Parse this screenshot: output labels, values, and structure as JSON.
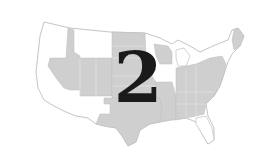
{
  "figure": {
    "number_label": "2",
    "colors": {
      "background": "#ffffff",
      "shaded_state": "#cfcfcf",
      "unshaded_state": "#ffffff",
      "border": "#b5b5b5",
      "number": "#1a1a1a"
    },
    "shaded_regions": [
      "Idaho",
      "Nevada",
      "Utah",
      "Wyoming",
      "Colorado",
      "North Dakota",
      "South Dakota",
      "Nebraska",
      "Kansas",
      "Oklahoma",
      "Texas",
      "Wisconsin",
      "Missouri",
      "Arkansas",
      "Louisiana",
      "Indiana",
      "Ohio",
      "Kentucky",
      "Tennessee",
      "Mississippi",
      "Alabama",
      "Georgia",
      "South Carolina",
      "North Carolina",
      "Virginia",
      "West Virginia",
      "Pennsylvania",
      "Maryland",
      "New Jersey",
      "Maine"
    ],
    "unshaded_regions": [
      "Washington",
      "Oregon",
      "California",
      "Montana",
      "Arizona",
      "New Mexico",
      "Minnesota",
      "Iowa",
      "Illinois",
      "Michigan",
      "New York",
      "Vermont",
      "New Hampshire",
      "Florida"
    ]
  }
}
